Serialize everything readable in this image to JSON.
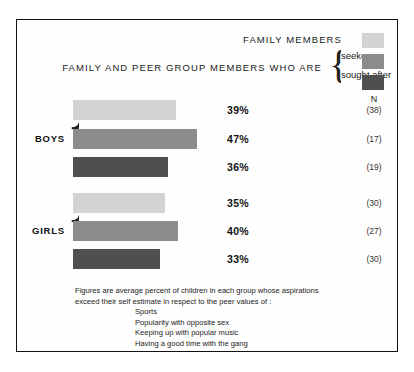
{
  "header": {
    "title": "FAMILY  MEMBERS",
    "subtitle": "FAMILY  AND  PEER  GROUP  MEMBERS  WHO  ARE",
    "legend_labels": [
      "seekers",
      "sought after"
    ],
    "n_header": "N"
  },
  "colors": {
    "family_members": "#d3d3d3",
    "seekers": "#8c8c8c",
    "sought_after": "#4f4f4f",
    "frame": "#111111",
    "text": "#1b1b1b"
  },
  "groups": [
    {
      "label": "BOYS",
      "rows": [
        {
          "series": "FAMILY MEMBERS",
          "value": 39,
          "value_label": "39%",
          "n": "(38)"
        },
        {
          "series": "seekers",
          "value": 47,
          "value_label": "47%",
          "n": "(17)"
        },
        {
          "series": "sought after",
          "value": 36,
          "value_label": "36%",
          "n": "(19)"
        }
      ]
    },
    {
      "label": "GIRLS",
      "rows": [
        {
          "series": "FAMILY MEMBERS",
          "value": 35,
          "value_label": "35%",
          "n": "(30)"
        },
        {
          "series": "seekers",
          "value": 40,
          "value_label": "40%",
          "n": "(27)"
        },
        {
          "series": "sought after",
          "value": 33,
          "value_label": "33%",
          "n": "(30)"
        }
      ]
    }
  ],
  "footnote": {
    "line1": "Figures are average percent of children in each group whose aspirations",
    "line2": "exceed their self estimate in respect to the peer values of :",
    "items": [
      "Sports",
      "Popularity with opposite sex",
      "Keeping up with popular music",
      "Having a good time with the gang"
    ]
  },
  "chart_data": {
    "type": "bar",
    "orientation": "horizontal",
    "title": "FAMILY  MEMBERS",
    "subtitle": "FAMILY  AND  PEER  GROUP  MEMBERS  WHO  ARE",
    "xlabel": "",
    "ylabel": "",
    "xlim": [
      0,
      100
    ],
    "grid": false,
    "legend_position": "top-right",
    "categories": [
      "BOYS",
      "GIRLS"
    ],
    "series": [
      {
        "name": "FAMILY MEMBERS",
        "color": "#d3d3d3",
        "values": [
          39,
          35
        ],
        "n": [
          38,
          30
        ]
      },
      {
        "name": "seekers",
        "color": "#8c8c8c",
        "values": [
          47,
          40
        ],
        "n": [
          17,
          27
        ]
      },
      {
        "name": "sought after",
        "color": "#4f4f4f",
        "values": [
          36,
          33
        ],
        "n": [
          19,
          30
        ]
      }
    ],
    "value_labels": [
      "39%",
      "47%",
      "36%",
      "35%",
      "40%",
      "33%"
    ],
    "n_column_header": "N",
    "n_values": [
      "(38)",
      "(17)",
      "(19)",
      "(30)",
      "(27)",
      "(30)"
    ],
    "annotations": [
      "Figures are average percent of children in each group whose aspirations exceed their self estimate in respect to the peer values of :",
      "Sports",
      "Popularity with opposite sex",
      "Keeping up with popular music",
      "Having a good time with the gang"
    ]
  }
}
